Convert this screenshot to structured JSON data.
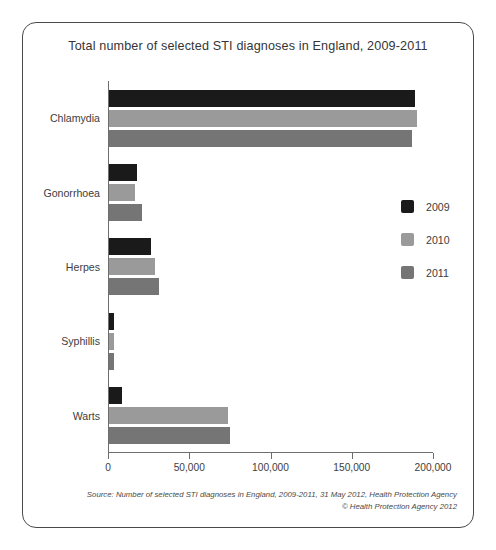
{
  "chart_data": {
    "type": "bar",
    "orientation": "horizontal",
    "title": "Total number of selected STI diagnoses in England, 2009-2011",
    "xlabel": "",
    "ylabel": "",
    "categories": [
      "Chlamydia",
      "Gonorrhoea",
      "Herpes",
      "Syphillis",
      "Warts"
    ],
    "series": [
      {
        "name": "2009",
        "color": "#1a1a1a",
        "values": [
          188000,
          17000,
          26000,
          3000,
          8000
        ]
      },
      {
        "name": "2010",
        "color": "#9a9a9a",
        "values": [
          189500,
          16000,
          28500,
          2800,
          73000
        ]
      },
      {
        "name": "2011",
        "color": "#757575",
        "values": [
          186500,
          20000,
          30500,
          3200,
          74500
        ]
      }
    ],
    "xlim": [
      0,
      200000
    ],
    "xticks": [
      0,
      50000,
      100000,
      150000,
      200000
    ],
    "xtick_labels": [
      "0",
      "50,000",
      "100,000",
      "150,000",
      "200,000"
    ],
    "grid": false,
    "legend_position": "right"
  },
  "legend": {
    "items": [
      {
        "label": "2009",
        "color": "#1a1a1a"
      },
      {
        "label": "2010",
        "color": "#9a9a9a"
      },
      {
        "label": "2011",
        "color": "#757575"
      }
    ]
  },
  "footer": {
    "line1": "Source: Number of selected STI diagnoses in England, 2009-2011,  31 May 2012, Health Protection Agency",
    "line2": "© Health Protection Agency 2012"
  }
}
